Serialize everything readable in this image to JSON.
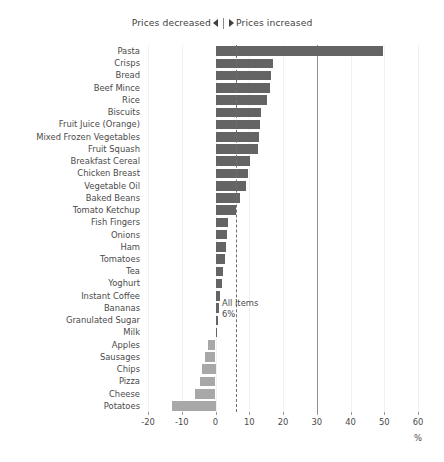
{
  "legend": {
    "decrease_label": "Prices decreased",
    "increase_label": "Prices increased",
    "decrease_icon": "triangle-left-icon",
    "increase_icon": "triangle-right-icon"
  },
  "annotation": {
    "title": "All items",
    "value": "6%"
  },
  "axis": {
    "unit": "%"
  },
  "colors": {
    "bar_positive": "#646464",
    "bar_negative": "#a8a8a8",
    "axis": "#8f8f8f",
    "gridline": "#f0f0f0",
    "dashed_reference": "#6f6f6f",
    "text": "#4a4a4a",
    "background": "#ffffff"
  },
  "chart_data": {
    "type": "bar",
    "orientation": "horizontal",
    "title": "",
    "subtitle": "",
    "xlabel": "%",
    "ylabel": "",
    "xlim": [
      -20,
      60
    ],
    "xticks": [
      -20,
      -10,
      0,
      10,
      20,
      30,
      40,
      50,
      60
    ],
    "xtick_labels": [
      "-20",
      "-10",
      "0",
      "10",
      "20",
      "30",
      "40",
      "50",
      "60"
    ],
    "grid": true,
    "grid_axis": "x",
    "legend_position": "top",
    "reference_line": {
      "label": "All items",
      "value": 6,
      "value_label": "6%",
      "style": "dashed"
    },
    "categories": [
      "Pasta",
      "Crisps",
      "Bread",
      "Beef Mince",
      "Rice",
      "Biscuits",
      "Fruit Juice (Orange)",
      "Mixed Frozen Vegetables",
      "Fruit Squash",
      "Breakfast Cereal",
      "Chicken Breast",
      "Vegetable Oil",
      "Baked Beans",
      "Tomato Ketchup",
      "Fish Fingers",
      "Onions",
      "Ham",
      "Tomatoes",
      "Tea",
      "Yoghurt",
      "Instant Coffee",
      "Bananas",
      "Granulated Sugar",
      "Milk",
      "Apples",
      "Sausages",
      "Chips",
      "Pizza",
      "Cheese",
      "Potatoes"
    ],
    "values": [
      49.5,
      17.0,
      16.4,
      16.0,
      15.3,
      13.5,
      13.1,
      12.8,
      12.5,
      10.3,
      9.6,
      9.0,
      7.3,
      6.2,
      3.6,
      3.3,
      3.0,
      2.7,
      2.3,
      1.9,
      1.2,
      0.9,
      0.6,
      0.1,
      -2.2,
      -3.1,
      -4.0,
      -4.6,
      -6.2,
      -13.0
    ],
    "value_unit": "%",
    "series_name": "Price change"
  }
}
